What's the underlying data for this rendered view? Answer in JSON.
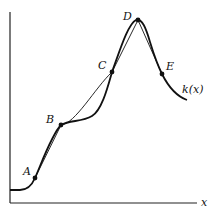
{
  "diagram": {
    "function_label": "k(x)",
    "x_axis_label": "x",
    "points": [
      {
        "name": "A",
        "x": 35,
        "y": 178,
        "label_x": 24,
        "label_y": 174
      },
      {
        "name": "B",
        "x": 61,
        "y": 125,
        "label_x": 47,
        "label_y": 122
      },
      {
        "name": "C",
        "x": 112,
        "y": 72,
        "label_x": 99,
        "label_y": 68
      },
      {
        "name": "D",
        "x": 138,
        "y": 20,
        "label_x": 124,
        "label_y": 19
      },
      {
        "name": "E",
        "x": 162,
        "y": 74,
        "label_x": 166,
        "label_y": 70
      }
    ],
    "labels": {
      "A": "A",
      "B": "B",
      "C": "C",
      "D": "D",
      "E": "E"
    }
  }
}
